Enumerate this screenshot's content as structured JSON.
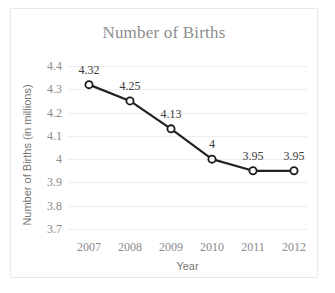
{
  "chart_data": {
    "type": "line",
    "title": "Number of Births",
    "xlabel": "Year",
    "ylabel": "Number of Births (in millions)",
    "categories": [
      "2007",
      "2008",
      "2009",
      "2010",
      "2011",
      "2012"
    ],
    "values": [
      4.32,
      4.25,
      4.13,
      4,
      3.95,
      3.95
    ],
    "point_labels": [
      "4.32",
      "4.25",
      "4.13",
      "4",
      "3.95",
      "3.95"
    ],
    "ylim": [
      3.7,
      4.4
    ],
    "yticks": [
      "4.4",
      "4.3",
      "4.2",
      "4.1",
      "4",
      "3.9",
      "3.8",
      "3.7"
    ],
    "ytick_values": [
      4.4,
      4.3,
      4.2,
      4.1,
      4.0,
      3.9,
      3.8,
      3.7
    ],
    "grid": "horizontal",
    "legend": "none",
    "colors": {
      "line": "#222222",
      "marker_fill": "#ffffff",
      "marker_stroke": "#1a1a1a",
      "gridline": "#ededed",
      "title_text": "#8e8e8e",
      "tick_text": "#8a8a8a",
      "axis_title_text": "#767676",
      "data_label_text": "#3a3a3a",
      "border": "#e9e9e9",
      "background": "#ffffff"
    }
  }
}
